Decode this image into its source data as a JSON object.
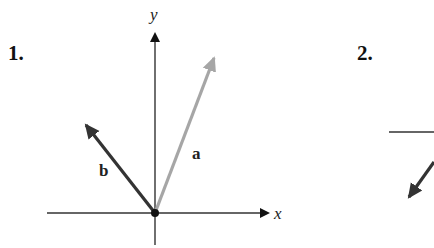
{
  "panels": [
    {
      "number": "1.",
      "axes": {
        "x_label": "x",
        "y_label": "y"
      },
      "vectors": [
        {
          "name": "a",
          "label": "a",
          "color": "#a6a6a6",
          "direction": [
            0.36,
            0.93
          ]
        },
        {
          "name": "b",
          "label": "b",
          "color": "#333333",
          "direction": [
            -0.6,
            0.8
          ]
        }
      ]
    },
    {
      "number": "2.",
      "partial": true,
      "colors": {
        "axis": "#333333",
        "vector": "#333333"
      }
    }
  ],
  "colors": {
    "axis": "#333333",
    "origin": "#111111"
  }
}
